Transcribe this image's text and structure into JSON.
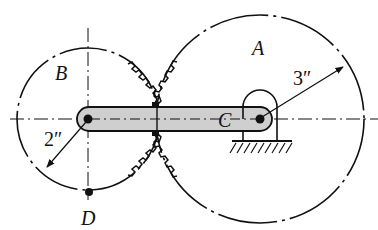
{
  "diagram": {
    "labels": {
      "gear_a": "A",
      "gear_b": "B",
      "pivot_c": "C",
      "point_d": "D",
      "radius_a": "3″",
      "radius_b": "2″"
    },
    "gear_a": {
      "center": [
        260,
        119
      ],
      "radius": 104
    },
    "gear_b": {
      "center": [
        88,
        119
      ],
      "radius": 71
    },
    "arm": {
      "from": [
        88,
        119
      ],
      "to": [
        260,
        119
      ],
      "color": "#cfcfcf"
    },
    "colors": {
      "stroke": "#111111",
      "arm_fill": "#cfcfcf"
    }
  }
}
